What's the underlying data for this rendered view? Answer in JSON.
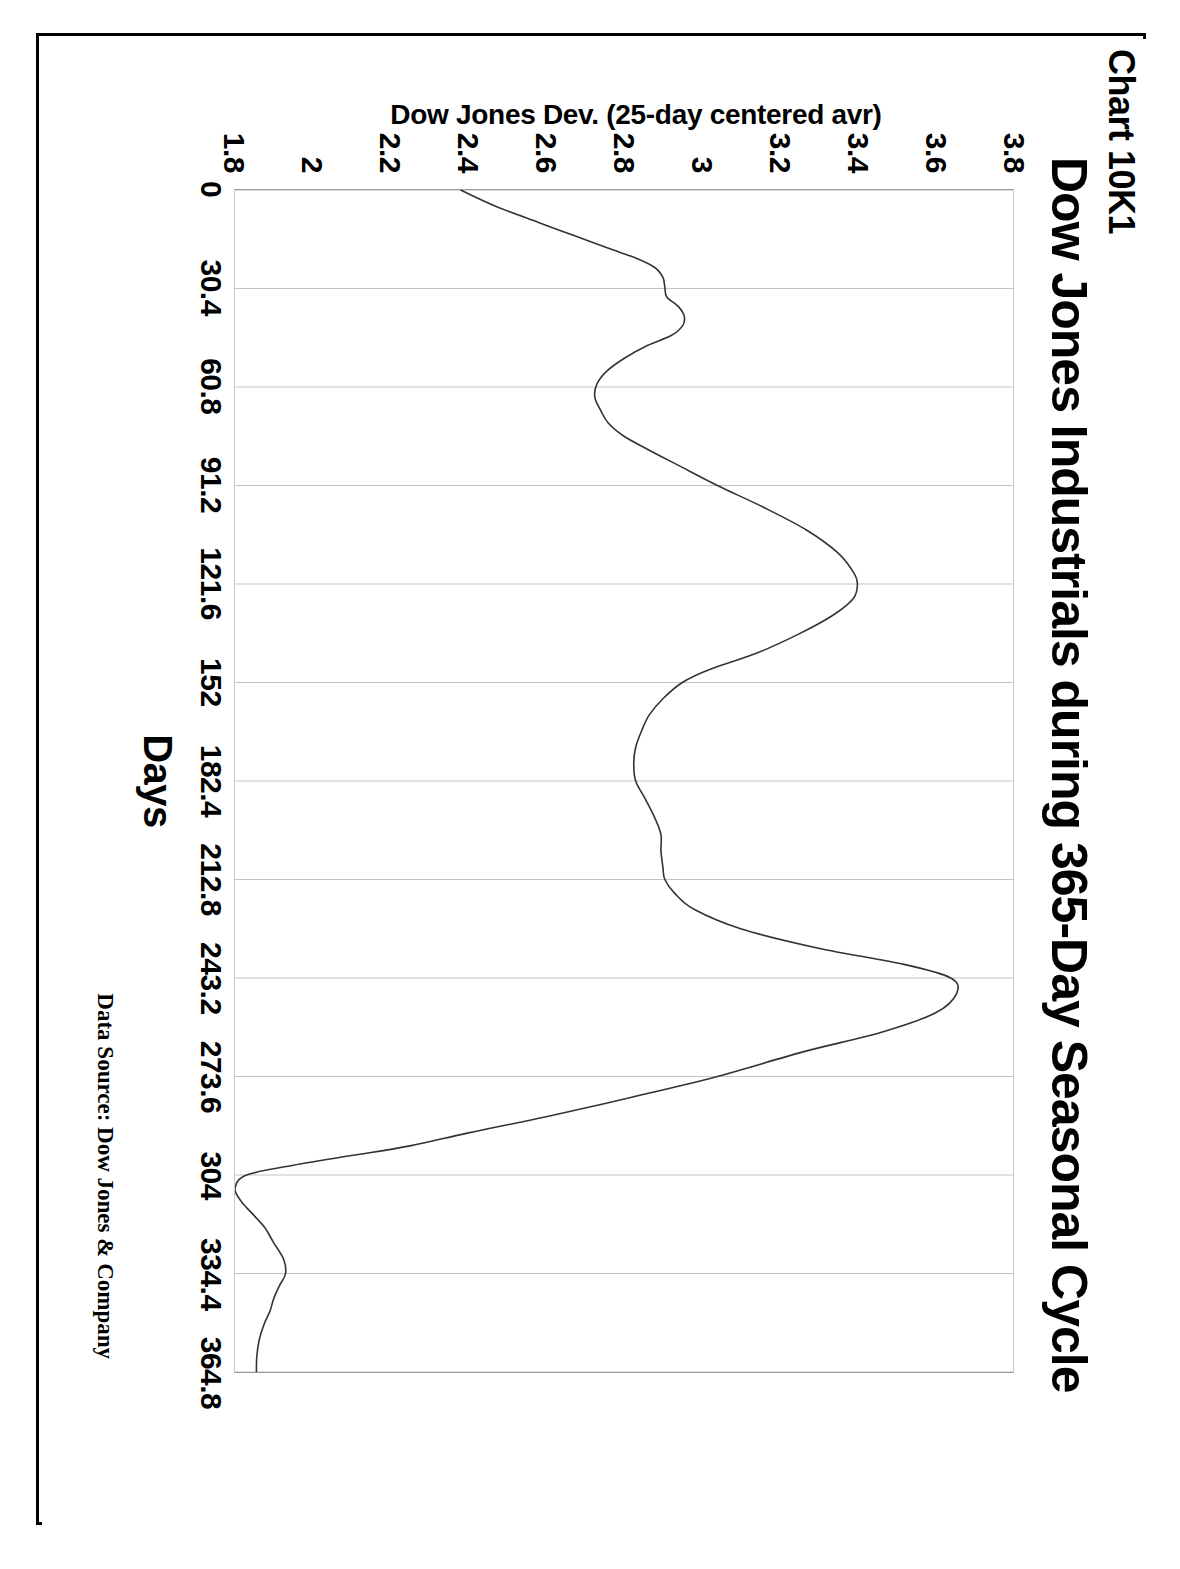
{
  "chart_label": "Chart 10K1",
  "title": "Dow Jones Industrials during 365-Day Seasonal Cycle",
  "x_axis_title": "Days",
  "y_axis_title": "Dow Jones Dev. (25-day centered avr)",
  "data_source": "Data Source:  Dow Jones & Company",
  "colors": {
    "frame": "#000000",
    "line": "#333333",
    "grid": "#bdbdbd",
    "background": "#ffffff"
  },
  "chart_data": {
    "type": "line",
    "title": "Dow Jones Industrials during 365-Day Seasonal Cycle",
    "subtitle": "Chart 10K1",
    "xlabel": "Days",
    "ylabel": "Dow Jones Dev. (25-day centered avr)",
    "annotation": "Data Source:  Dow Jones & Company",
    "xlim": [
      0,
      364.8
    ],
    "ylim": [
      1.8,
      3.8
    ],
    "xticks": [
      "0",
      "30.4",
      "60.8",
      "91.2",
      "121.6",
      "152",
      "182.4",
      "212.8",
      "243.2",
      "273.6",
      "304",
      "334.4",
      "364.8"
    ],
    "xtick_values": [
      0,
      30.4,
      60.8,
      91.2,
      121.6,
      152,
      182.4,
      212.8,
      243.2,
      273.6,
      304,
      334.4,
      364.8
    ],
    "yticks": [
      "3.8",
      "3.6",
      "3.4",
      "3.2",
      "3",
      "2.8",
      "2.6",
      "2.4",
      "2.2",
      "2",
      "1.8"
    ],
    "ytick_values": [
      3.8,
      3.6,
      3.4,
      3.2,
      3.0,
      2.8,
      2.6,
      2.4,
      2.2,
      2.0,
      1.8
    ],
    "grid": "vertical-only",
    "legend": "none",
    "series": [
      {
        "name": "Dow Jones Dev. (25-day centered avr)",
        "x": [
          0,
          5,
          10,
          14,
          18,
          21,
          24,
          27,
          30,
          33,
          36,
          39,
          42,
          45,
          48,
          52,
          56,
          60,
          64,
          68,
          72,
          76,
          80,
          85,
          91.2,
          98,
          105,
          112,
          118,
          121.6,
          126,
          131,
          137,
          143,
          148,
          152,
          157,
          162,
          167,
          172,
          177,
          182.4,
          188,
          194,
          199,
          204,
          209,
          212.8,
          217,
          222,
          228,
          234,
          239,
          243.2,
          248,
          254,
          260,
          266,
          273.6,
          280,
          286,
          291,
          295,
          298,
          301,
          304,
          308,
          312,
          316,
          320,
          325,
          330,
          334.4,
          338,
          342,
          346,
          350,
          355,
          360,
          364.8
        ],
        "y": [
          2.38,
          2.47,
          2.58,
          2.67,
          2.76,
          2.83,
          2.88,
          2.9,
          2.905,
          2.91,
          2.94,
          2.955,
          2.95,
          2.92,
          2.86,
          2.8,
          2.755,
          2.73,
          2.725,
          2.74,
          2.76,
          2.8,
          2.86,
          2.94,
          3.04,
          3.16,
          3.27,
          3.35,
          3.39,
          3.4,
          3.39,
          3.34,
          3.25,
          3.14,
          3.02,
          2.95,
          2.9,
          2.865,
          2.845,
          2.83,
          2.825,
          2.83,
          2.855,
          2.88,
          2.895,
          2.895,
          2.9,
          2.905,
          2.93,
          2.98,
          3.1,
          3.3,
          3.52,
          3.64,
          3.655,
          3.6,
          3.46,
          3.26,
          3.04,
          2.82,
          2.6,
          2.4,
          2.25,
          2.1,
          1.95,
          1.83,
          1.8,
          1.815,
          1.845,
          1.875,
          1.9,
          1.925,
          1.93,
          1.915,
          1.9,
          1.89,
          1.875,
          1.862,
          1.856,
          1.855
        ]
      }
    ]
  }
}
